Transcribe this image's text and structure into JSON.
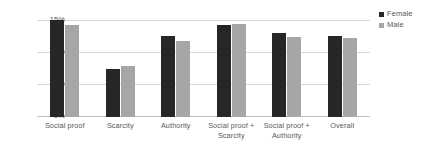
{
  "chart_data": {
    "type": "bar",
    "title": "",
    "subtitle": "",
    "xlabel": "",
    "ylabel": "",
    "ylim": [
      0,
      15
    ],
    "grid": true,
    "legend_position": "right-top",
    "categories": [
      "Social proof",
      "Scarcity",
      "Authority",
      "Social proof + Scarcity",
      "Social proof + Authority",
      "Overall"
    ],
    "ytick_labels": [
      "15%",
      "10%",
      "5%",
      "0%"
    ],
    "ytick_values": [
      15,
      10,
      5,
      0
    ],
    "series": [
      {
        "name": "Female",
        "color": "#262626",
        "values": [
          15.0,
          7.5,
          12.5,
          14.3,
          13.0,
          12.5
        ]
      },
      {
        "name": "Male",
        "color": "#a6a6a6",
        "values": [
          14.2,
          7.9,
          11.7,
          14.4,
          12.4,
          12.2
        ]
      }
    ]
  },
  "legend": {
    "items": [
      {
        "label": "Female",
        "swatch": "legend-swatch-female"
      },
      {
        "label": "Male",
        "swatch": "legend-swatch-male"
      }
    ]
  }
}
